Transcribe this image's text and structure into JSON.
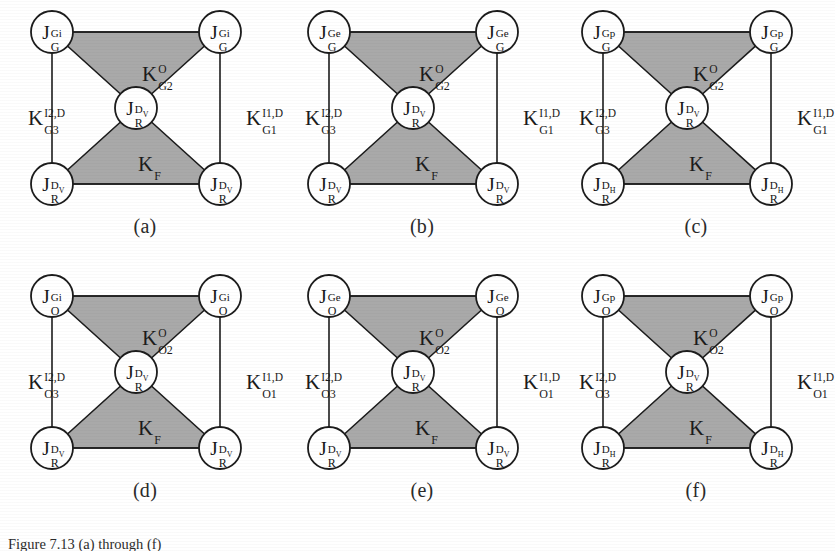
{
  "figure": {
    "width": 835,
    "height": 551,
    "background": "#ffffff",
    "shade_color": "#a9a9a9",
    "stroke_color": "#1c1c1c",
    "node_fill": "#ffffff",
    "caption_text": "Figure 7.13  (a) through (f)"
  },
  "common": {
    "center_node": {
      "base": "J",
      "sup_main": "D",
      "sup_tiny": "V",
      "sub": "R"
    },
    "lower_region_label": {
      "base": "K",
      "sup": "",
      "sub": "F"
    },
    "upper_region_sup": "O"
  },
  "panels": [
    {
      "id": "a",
      "caption": "(a)",
      "top_nodes": {
        "base": "J",
        "sup": "Gi",
        "sub": "G"
      },
      "bottom_nodes": {
        "base": "J",
        "sup_main": "D",
        "sup_tiny": "V",
        "sub": "R"
      },
      "center_node": {
        "base": "J",
        "sup_main": "D",
        "sup_tiny": "V",
        "sub": "R"
      },
      "upper_label": {
        "base": "K",
        "sup": "O",
        "sub": "G2"
      },
      "lower_label": {
        "base": "K",
        "sup": "",
        "sub": "F"
      },
      "left_label": {
        "base": "K",
        "sup": "I2,D",
        "sub": "G3"
      },
      "right_label": {
        "base": "K",
        "sup": "I1,D",
        "sub": "G1"
      }
    },
    {
      "id": "b",
      "caption": "(b)",
      "top_nodes": {
        "base": "J",
        "sup": "Ge",
        "sub": "G"
      },
      "bottom_nodes": {
        "base": "J",
        "sup_main": "D",
        "sup_tiny": "V",
        "sub": "R"
      },
      "center_node": {
        "base": "J",
        "sup_main": "D",
        "sup_tiny": "V",
        "sub": "R"
      },
      "upper_label": {
        "base": "K",
        "sup": "O",
        "sub": "G2"
      },
      "lower_label": {
        "base": "K",
        "sup": "",
        "sub": "F"
      },
      "left_label": {
        "base": "K",
        "sup": "I2,D",
        "sub": "G3"
      },
      "right_label": {
        "base": "K",
        "sup": "I1,D",
        "sub": "G1"
      }
    },
    {
      "id": "c",
      "caption": "(c)",
      "top_nodes": {
        "base": "J",
        "sup": "Gp",
        "sub": "G"
      },
      "bottom_nodes": {
        "base": "J",
        "sup_main": "D",
        "sup_tiny": "H",
        "sub": "R"
      },
      "center_node": {
        "base": "J",
        "sup_main": "D",
        "sup_tiny": "V",
        "sub": "R"
      },
      "upper_label": {
        "base": "K",
        "sup": "O",
        "sub": "G2"
      },
      "lower_label": {
        "base": "K",
        "sup": "",
        "sub": "F"
      },
      "left_label": {
        "base": "K",
        "sup": "I2,D",
        "sub": "G3"
      },
      "right_label": {
        "base": "K",
        "sup": "I1,D",
        "sub": "G1"
      }
    },
    {
      "id": "d",
      "caption": "(d)",
      "top_nodes": {
        "base": "J",
        "sup": "Gi",
        "sub": "O"
      },
      "bottom_nodes": {
        "base": "J",
        "sup_main": "D",
        "sup_tiny": "V",
        "sub": "R"
      },
      "center_node": {
        "base": "J",
        "sup_main": "D",
        "sup_tiny": "V",
        "sub": "R"
      },
      "upper_label": {
        "base": "K",
        "sup": "O",
        "sub": "O2"
      },
      "lower_label": {
        "base": "K",
        "sup": "",
        "sub": "F"
      },
      "left_label": {
        "base": "K",
        "sup": "I2,D",
        "sub": "O3"
      },
      "right_label": {
        "base": "K",
        "sup": "I1,D",
        "sub": "O1"
      }
    },
    {
      "id": "e",
      "caption": "(e)",
      "top_nodes": {
        "base": "J",
        "sup": "Ge",
        "sub": "O"
      },
      "bottom_nodes": {
        "base": "J",
        "sup_main": "D",
        "sup_tiny": "V",
        "sub": "R"
      },
      "center_node": {
        "base": "J",
        "sup_main": "D",
        "sup_tiny": "V",
        "sub": "R"
      },
      "upper_label": {
        "base": "K",
        "sup": "O",
        "sub": "O2"
      },
      "lower_label": {
        "base": "K",
        "sup": "",
        "sub": "F"
      },
      "left_label": {
        "base": "K",
        "sup": "I2,D",
        "sub": "O3"
      },
      "right_label": {
        "base": "K",
        "sup": "I1,D",
        "sub": "O1"
      }
    },
    {
      "id": "f",
      "caption": "(f)",
      "top_nodes": {
        "base": "J",
        "sup": "Gp",
        "sub": "O"
      },
      "bottom_nodes": {
        "base": "J",
        "sup_main": "D",
        "sup_tiny": "H",
        "sub": "R"
      },
      "center_node": {
        "base": "J",
        "sup_main": "D",
        "sup_tiny": "V",
        "sub": "R"
      },
      "upper_label": {
        "base": "K",
        "sup": "O",
        "sub": "O2"
      },
      "lower_label": {
        "base": "K",
        "sup": "",
        "sub": "F"
      },
      "left_label": {
        "base": "K",
        "sup": "I2,D",
        "sub": "O3"
      },
      "right_label": {
        "base": "K",
        "sup": "I1,D",
        "sub": "O1"
      }
    }
  ]
}
